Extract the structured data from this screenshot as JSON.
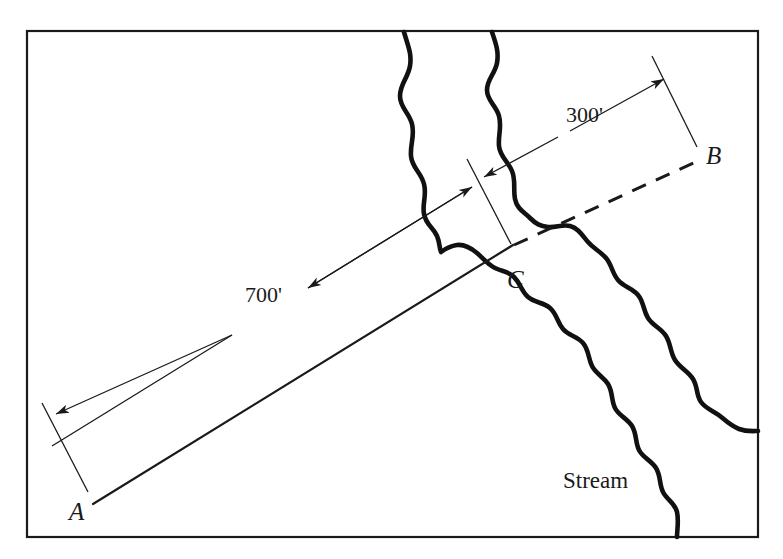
{
  "figure": {
    "background_color": "#ffffff",
    "ink_color": "#1a1a1a",
    "frame": {
      "name": "figure-border",
      "x": 27,
      "y": 31,
      "width": 731,
      "height": 506
    },
    "labels": {
      "point_a": "A",
      "point_b": "B",
      "point_c": "C",
      "distance_ac": "700'",
      "distance_cb": "300'",
      "stream": "Stream"
    },
    "points": {
      "a": {
        "label": "A",
        "x": 93,
        "y": 504
      },
      "b": {
        "label": "B",
        "x": 700,
        "y": 160
      },
      "c": {
        "label": "C",
        "x": 512,
        "y": 246
      }
    },
    "segments": [
      {
        "name": "segment-a-to-c",
        "from": "A",
        "to": "C",
        "style": "solid",
        "length_label": "700'"
      },
      {
        "name": "segment-c-to-b",
        "from": "C",
        "to": "B",
        "style": "dashed",
        "length_label": "300'"
      }
    ],
    "dimensions": [
      {
        "name": "dimension-700",
        "label": "700'",
        "label_x": 268,
        "label_y": 300,
        "arrow_from": "C",
        "arrow_to": "A"
      },
      {
        "name": "dimension-300",
        "label": "300'",
        "label_x": 600,
        "label_y": 117,
        "arrow_from": "C",
        "arrow_to": "B"
      }
    ],
    "stream": {
      "label": "Stream",
      "label_x": 563,
      "label_y": 488,
      "banks": 2
    }
  }
}
